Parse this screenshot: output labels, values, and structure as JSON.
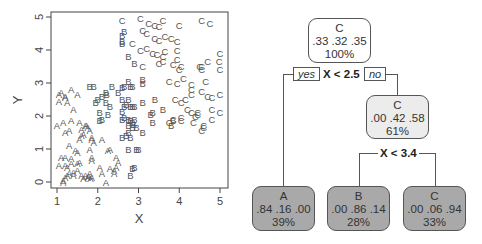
{
  "chart_data": [
    {
      "type": "scatter",
      "title": "",
      "xlabel": "X",
      "ylabel": "Y",
      "xlim": [
        0.95,
        5.15
      ],
      "ylim": [
        -0.18,
        5.15
      ],
      "xticks": [
        1,
        2,
        3,
        4,
        5
      ],
      "yticks": [
        0,
        1,
        2,
        3,
        4,
        5
      ],
      "grid": false,
      "legend": "none",
      "marker": "class letter",
      "series": [
        {
          "name": "A",
          "points": [
            [
              1.05,
              2.65
            ],
            [
              1.1,
              2.7
            ],
            [
              1.05,
              2.45
            ],
            [
              1.2,
              2.6
            ],
            [
              1.25,
              2.4
            ],
            [
              1.35,
              2.8
            ],
            [
              1.5,
              2.65
            ],
            [
              1.4,
              2.2
            ],
            [
              1.2,
              2.55
            ],
            [
              1.0,
              1.7
            ],
            [
              1.15,
              1.8
            ],
            [
              1.2,
              1.5
            ],
            [
              1.3,
              1.55
            ],
            [
              1.35,
              1.85
            ],
            [
              1.55,
              1.8
            ],
            [
              1.6,
              1.6
            ],
            [
              1.65,
              1.45
            ],
            [
              1.7,
              1.7
            ],
            [
              1.75,
              1.65
            ],
            [
              1.72,
              1.72
            ],
            [
              1.8,
              1.55
            ],
            [
              1.85,
              1.35
            ],
            [
              1.55,
              1.3
            ],
            [
              1.6,
              1.4
            ],
            [
              1.45,
              0.95
            ],
            [
              1.3,
              1.1
            ],
            [
              1.8,
              1.0
            ],
            [
              1.85,
              1.3
            ],
            [
              1.9,
              1.2
            ],
            [
              2.1,
              1.3
            ],
            [
              2.25,
              0.95
            ],
            [
              2.3,
              1.0
            ],
            [
              1.1,
              0.75
            ],
            [
              1.2,
              0.75
            ],
            [
              1.35,
              0.7
            ],
            [
              1.5,
              0.9
            ],
            [
              1.55,
              0.6
            ],
            [
              1.85,
              0.65
            ],
            [
              1.85,
              0.75
            ],
            [
              1.2,
              0.5
            ],
            [
              1.35,
              0.55
            ],
            [
              1.5,
              0.55
            ],
            [
              1.05,
              0.5
            ],
            [
              1.25,
              0.45
            ],
            [
              1.4,
              0.3
            ],
            [
              1.5,
              0.35
            ],
            [
              1.6,
              0.2
            ],
            [
              1.75,
              0.15
            ],
            [
              1.8,
              0.25
            ],
            [
              1.85,
              0.15
            ],
            [
              2.05,
              0.45
            ],
            [
              2.1,
              0.25
            ],
            [
              2.3,
              0.4
            ],
            [
              2.4,
              0.35
            ],
            [
              2.45,
              0.75
            ],
            [
              2.5,
              0.6
            ],
            [
              2.45,
              0.45
            ],
            [
              2.4,
              0.25
            ],
            [
              2.2,
              0.0
            ],
            [
              1.15,
              0.05
            ],
            [
              1.2,
              0.15
            ],
            [
              1.25,
              0.2
            ],
            [
              1.3,
              0.25
            ],
            [
              1.15,
              0.0
            ],
            [
              1.7,
              0.2
            ],
            [
              1.82,
              0.1
            ],
            [
              1.78,
              0.18
            ],
            [
              1.65,
              0.1
            ],
            [
              1.4,
              0.2
            ]
          ]
        },
        {
          "name": "B",
          "points": [
            [
              2.6,
              4.45
            ],
            [
              2.65,
              4.55
            ],
            [
              2.6,
              4.2
            ],
            [
              2.6,
              4.25
            ],
            [
              2.75,
              3.8
            ],
            [
              2.9,
              3.6
            ],
            [
              3.1,
              3.1
            ],
            [
              3.1,
              3.0
            ],
            [
              2.75,
              3.05
            ],
            [
              1.8,
              2.9
            ],
            [
              1.9,
              2.9
            ],
            [
              2.35,
              2.9
            ],
            [
              2.2,
              2.7
            ],
            [
              2.22,
              2.65
            ],
            [
              2.0,
              2.5
            ],
            [
              2.1,
              2.6
            ],
            [
              1.95,
              2.4
            ],
            [
              2.2,
              2.4
            ],
            [
              2.3,
              2.3
            ],
            [
              2.5,
              2.7
            ],
            [
              2.6,
              2.85
            ],
            [
              2.65,
              2.9
            ],
            [
              2.8,
              2.9
            ],
            [
              2.85,
              2.9
            ],
            [
              2.6,
              2.5
            ],
            [
              2.75,
              2.5
            ],
            [
              2.65,
              2.3
            ],
            [
              2.7,
              2.35
            ],
            [
              2.8,
              2.3
            ],
            [
              2.85,
              2.3
            ],
            [
              2.9,
              2.3
            ],
            [
              2.05,
              2.1
            ],
            [
              2.25,
              2.05
            ],
            [
              2.1,
              1.9
            ],
            [
              2.05,
              1.85
            ],
            [
              2.6,
              2.15
            ],
            [
              2.6,
              1.9
            ],
            [
              2.65,
              1.95
            ],
            [
              2.75,
              1.9
            ],
            [
              2.8,
              1.85
            ],
            [
              2.85,
              1.8
            ],
            [
              2.88,
              1.75
            ],
            [
              2.9,
              1.9
            ],
            [
              2.75,
              1.7
            ],
            [
              2.85,
              1.65
            ],
            [
              2.95,
              1.65
            ],
            [
              3.1,
              2.4
            ],
            [
              3.4,
              2.5
            ],
            [
              3.6,
              2.2
            ],
            [
              3.35,
              2.1
            ],
            [
              3.3,
              2.05
            ],
            [
              3.35,
              1.8
            ],
            [
              2.6,
              1.35
            ],
            [
              2.7,
              1.4
            ],
            [
              2.75,
              1.5
            ],
            [
              2.8,
              1.35
            ],
            [
              2.75,
              1.0
            ],
            [
              2.95,
              1.0
            ],
            [
              3.0,
              1.0
            ],
            [
              3.1,
              1.5
            ],
            [
              3.8,
              1.7
            ],
            [
              3.85,
              1.85
            ],
            [
              2.9,
              0.45
            ],
            [
              2.85,
              0.4
            ],
            [
              2.8,
              0.2
            ]
          ]
        },
        {
          "name": "C",
          "points": [
            [
              2.6,
              4.9
            ],
            [
              3.05,
              4.95
            ],
            [
              3.25,
              4.8
            ],
            [
              3.4,
              4.75
            ],
            [
              3.5,
              4.7
            ],
            [
              3.6,
              4.9
            ],
            [
              4.0,
              4.75
            ],
            [
              4.55,
              4.9
            ],
            [
              4.75,
              4.8
            ],
            [
              3.1,
              4.6
            ],
            [
              3.2,
              4.5
            ],
            [
              2.85,
              4.2
            ],
            [
              3.4,
              4.35
            ],
            [
              3.5,
              4.3
            ],
            [
              3.65,
              4.4
            ],
            [
              3.8,
              4.35
            ],
            [
              3.95,
              4.25
            ],
            [
              3.95,
              4.0
            ],
            [
              3.05,
              4.0
            ],
            [
              3.2,
              4.05
            ],
            [
              3.35,
              3.9
            ],
            [
              3.45,
              3.85
            ],
            [
              3.65,
              3.95
            ],
            [
              3.6,
              3.8
            ],
            [
              3.1,
              3.5
            ],
            [
              3.5,
              3.6
            ],
            [
              3.6,
              3.65
            ],
            [
              3.85,
              3.55
            ],
            [
              3.95,
              3.7
            ],
            [
              4.05,
              3.5
            ],
            [
              4.0,
              3.4
            ],
            [
              3.75,
              3.05
            ],
            [
              3.95,
              3.0
            ],
            [
              4.1,
              3.15
            ],
            [
              4.3,
              2.95
            ],
            [
              4.3,
              2.8
            ],
            [
              4.5,
              3.5
            ],
            [
              4.55,
              3.5
            ],
            [
              4.55,
              3.4
            ],
            [
              4.7,
              3.65
            ],
            [
              4.65,
              3.05
            ],
            [
              5.0,
              3.9
            ],
            [
              4.98,
              3.65
            ],
            [
              5.0,
              3.4
            ],
            [
              4.55,
              2.75
            ],
            [
              4.7,
              2.6
            ],
            [
              4.8,
              2.55
            ],
            [
              5.0,
              2.65
            ],
            [
              3.9,
              2.5
            ],
            [
              4.05,
              2.4
            ],
            [
              4.15,
              2.5
            ],
            [
              4.3,
              2.65
            ],
            [
              4.2,
              2.2
            ],
            [
              4.3,
              2.1
            ],
            [
              4.4,
              2.0
            ],
            [
              4.45,
              2.1
            ],
            [
              4.45,
              2.05
            ],
            [
              4.6,
              1.65
            ],
            [
              4.55,
              1.55
            ],
            [
              4.8,
              2.2
            ],
            [
              4.8,
              1.9
            ],
            [
              5.0,
              2.1
            ],
            [
              3.75,
              1.8
            ],
            [
              3.85,
              1.9
            ],
            [
              4.05,
              1.95
            ],
            [
              4.05,
              1.85
            ],
            [
              4.35,
              1.8
            ],
            [
              4.6,
              1.7
            ]
          ]
        }
      ]
    },
    {
      "type": "decision_tree",
      "title": "",
      "class_order": [
        "A",
        "B",
        "C"
      ],
      "nodes": [
        {
          "id": "root",
          "label": "C",
          "probs": ".33 .32 .35",
          "pct": "100%",
          "fill": "#ffffff"
        },
        {
          "id": "right",
          "label": "C",
          "probs": ".00 .42 .58",
          "pct": "61%",
          "fill": "#ececec"
        },
        {
          "id": "leafA",
          "label": "A",
          "probs": ".84 .16 .00",
          "pct": "39%",
          "fill": "#a9a9a9"
        },
        {
          "id": "leafB",
          "label": "B",
          "probs": ".00 .86 .14",
          "pct": "28%",
          "fill": "#a9a9a9"
        },
        {
          "id": "leafC",
          "label": "C",
          "probs": ".00 .06 .94",
          "pct": "33%",
          "fill": "#a9a9a9"
        }
      ],
      "splits": [
        {
          "node": "root",
          "rule": "X < 2.5",
          "yes_label": "yes",
          "no_label": "no"
        },
        {
          "node": "right",
          "rule": "X < 3.4"
        }
      ]
    }
  ]
}
